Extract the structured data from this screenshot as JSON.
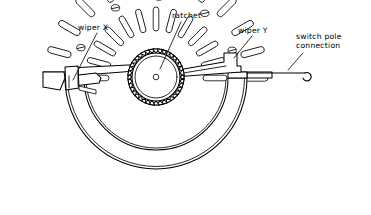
{
  "figure": {
    "kind": "technical-line-diagram",
    "background_color": "#ffffff",
    "line_color": "#000000",
    "width": 371,
    "height": 215
  },
  "labels": {
    "wiper_x": "wiper X",
    "ratchet": "ratchet",
    "wiper_y": "wiper Y",
    "switch_pole_line1": "switch pole",
    "switch_pole_line2": "connection"
  },
  "parts": {
    "ratchet_wheel": {
      "name": "ratchet",
      "center_x": 156,
      "center_y": 77,
      "outer_radius": 28,
      "root_radius": 24,
      "rim_radius": 21,
      "hub_radius": 2.6,
      "teeth": 40
    },
    "contact_bank": {
      "name": "semicircular contact bank",
      "center_x": 156,
      "center_y": 78,
      "inner_radius": 72,
      "outer_radius": 91,
      "start_angle_deg": 0,
      "end_angle_deg": 180,
      "outer_pins": 13,
      "inner_pins": 13,
      "screw_heads": 5
    },
    "wiper_x": {
      "name": "wiper X",
      "side": "left",
      "arm_from_x": 69,
      "arm_to_x": 140
    },
    "wiper_y": {
      "name": "wiper Y",
      "side": "right",
      "arm_from_x": 172,
      "arm_to_x": 240
    },
    "switch_pole_connection": {
      "name": "switch pole connection",
      "wire_start_x": 272,
      "wire_end_x": 313,
      "wire_y": 73,
      "terminal": "hook-loop"
    }
  },
  "leader_lines": [
    {
      "name": "leader-wiper-x",
      "x1": 97,
      "y1": 33,
      "x2": 73,
      "y2": 80
    },
    {
      "name": "leader-ratchet",
      "x1": 180,
      "y1": 22,
      "x2": 160,
      "y2": 68
    },
    {
      "name": "leader-wiper-y",
      "x1": 252,
      "y1": 36,
      "x2": 235,
      "y2": 57
    },
    {
      "name": "leader-switch-pole",
      "x1": 302,
      "y1": 53,
      "x2": 288,
      "y2": 69
    }
  ],
  "label_positions": {
    "wiper_x": {
      "x": 78,
      "y": 29
    },
    "ratchet": {
      "x": 172,
      "y": 17
    },
    "wiper_y": {
      "x": 238,
      "y": 32
    },
    "switch_pole": {
      "x": 296,
      "y": 38
    }
  }
}
